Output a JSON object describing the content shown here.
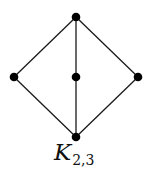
{
  "graph": {
    "name": "K_{2,3}",
    "colors": {
      "edge": "#1a1a1a",
      "node": "#000000",
      "background": "#ffffff"
    },
    "nodes": [
      {
        "id": "top",
        "x": 76,
        "y": 17
      },
      {
        "id": "left",
        "x": 14,
        "y": 77
      },
      {
        "id": "center",
        "x": 76,
        "y": 77
      },
      {
        "id": "right",
        "x": 138,
        "y": 77
      },
      {
        "id": "bottom",
        "x": 76,
        "y": 137
      }
    ],
    "edges": [
      [
        "top",
        "left"
      ],
      [
        "top",
        "center"
      ],
      [
        "top",
        "right"
      ],
      [
        "bottom",
        "left"
      ],
      [
        "bottom",
        "center"
      ],
      [
        "bottom",
        "right"
      ]
    ]
  },
  "label": {
    "main": "K",
    "subscript": "2,3"
  }
}
